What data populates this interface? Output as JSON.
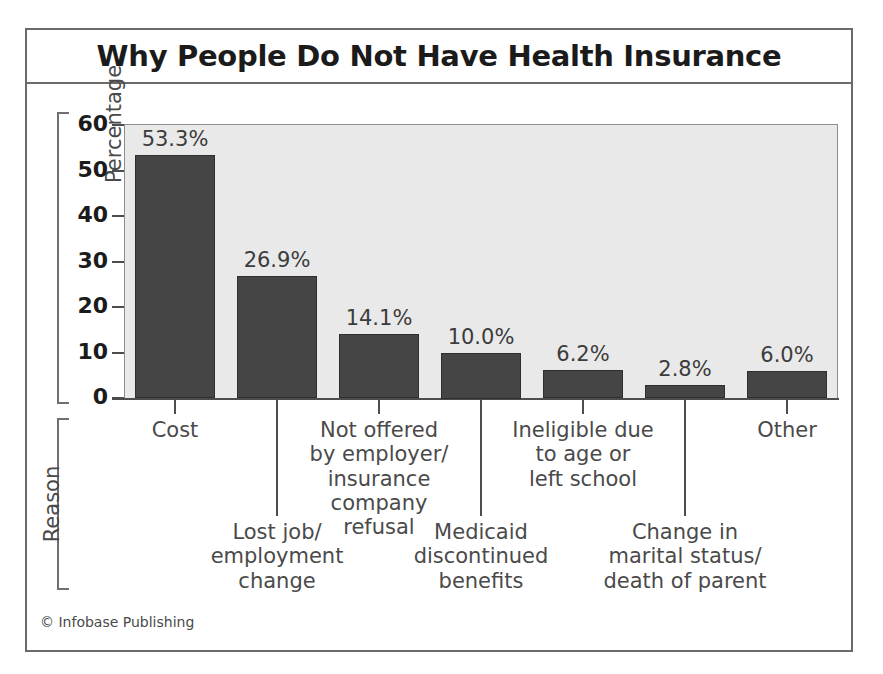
{
  "chart_data": {
    "type": "bar",
    "title": "Why People Do Not Have Health Insurance",
    "xlabel": "Reason",
    "ylabel": "Percentage",
    "ylim": [
      0,
      60
    ],
    "yticks": [
      0,
      10,
      20,
      30,
      40,
      50,
      60
    ],
    "grid": false,
    "legend": null,
    "categories": [
      "Cost",
      "Lost job/\nemployment\nchange",
      "Not offered\nby employer/\ninsurance\ncompany\nrefusal",
      "Medicaid\ndiscontinued\nbenefits",
      "Ineligible due\nto age or\nleft school",
      "Change in\nmarital status/\ndeath of parent",
      "Other"
    ],
    "values": [
      53.3,
      26.9,
      14.1,
      10.0,
      6.2,
      2.8,
      6.0
    ],
    "value_labels": [
      "53.3%",
      "26.9%",
      "14.1%",
      "10.0%",
      "6.2%",
      "2.8%",
      "6.0%"
    ],
    "bar_color": "#454545",
    "plot_background": "#e9e9e9",
    "label_rows": [
      "upper",
      "lower",
      "upper",
      "lower",
      "upper",
      "lower",
      "upper"
    ]
  },
  "credit": "© Infobase Publishing"
}
